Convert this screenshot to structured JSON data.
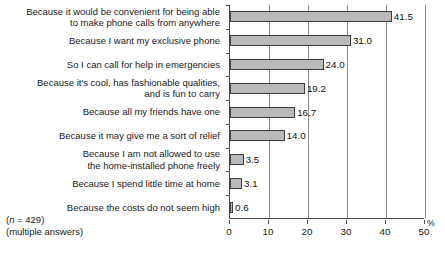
{
  "chart_data": {
    "type": "bar",
    "orientation": "horizontal",
    "title": "",
    "subtitle": "",
    "xlabel": "%",
    "ylabel": "",
    "xlim": [
      0,
      50
    ],
    "grid": true,
    "legend": null,
    "categories": [
      "Because it would be convenient for being able\nto make phone calls from anywhere",
      "Because I want my exclusive phone",
      "So I can call for help in emergencies",
      "Because it's cool, has fashionable qualities,\nand is fun to carry",
      "Because all my friends have one",
      "Because it may give me a sort of relief",
      "Because I am not allowed to use\nthe home-installed phone freely",
      "Because I spend little time at home",
      "Because the costs do not seem high"
    ],
    "values": [
      41.5,
      31.0,
      24.0,
      19.2,
      16.7,
      14.0,
      3.5,
      3.1,
      0.6
    ],
    "value_labels": [
      "41.5",
      "31.0",
      "24.0",
      "19.2",
      "16.7",
      "14.0",
      "3.5",
      "3.1",
      "0.6"
    ],
    "xticks": [
      0,
      10,
      20,
      30,
      40,
      50
    ],
    "xtick_labels": [
      "0",
      "10",
      "20",
      "30",
      "40",
      "50"
    ],
    "bar_color": "#b9b9b9",
    "bar_edge_color": "#3d3d3d",
    "axis_color": "#4a4a4a",
    "gridline_color": "#8a8a8a"
  },
  "footnote": {
    "sample_prefix": "(",
    "sample_symbol": "n",
    "sample_text": " = 429)",
    "line2": "(multiple answers)"
  },
  "axis": {
    "percent_symbol": "%"
  }
}
